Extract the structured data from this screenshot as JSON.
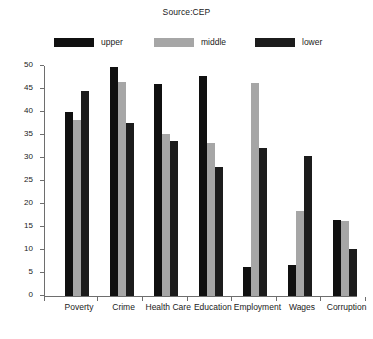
{
  "chart_data": {
    "type": "bar",
    "title": "Source:CEP",
    "xlabel": "",
    "ylabel": "",
    "ylim": [
      0,
      50
    ],
    "ytick_step": 5,
    "yticks": [
      0,
      5,
      10,
      15,
      20,
      25,
      30,
      35,
      40,
      45,
      50
    ],
    "grid": false,
    "legend_position": "top",
    "categories": [
      "Poverty",
      "Crime",
      "Health Care",
      "Education",
      "Employment",
      "Wages",
      "Corruption"
    ],
    "series": [
      {
        "name": "upper",
        "color": "#101010",
        "values": [
          40.0,
          49.7,
          46.1,
          47.9,
          6.4,
          6.7,
          16.5
        ]
      },
      {
        "name": "middle",
        "color": "#a6a6a6",
        "values": [
          38.3,
          46.5,
          35.2,
          33.2,
          46.4,
          18.4,
          16.3
        ]
      },
      {
        "name": "lower",
        "color": "#1c1c1c",
        "values": [
          44.5,
          37.7,
          33.8,
          28.0,
          32.2,
          30.5,
          10.3
        ]
      }
    ]
  },
  "axes": {
    "axis_color": "#6e6e6e"
  }
}
